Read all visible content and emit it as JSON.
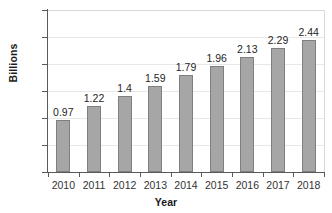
{
  "chart_data": {
    "type": "bar",
    "title": "",
    "subtitle": "",
    "xlabel": "Year",
    "ylabel": "Billions",
    "categories": [
      "2010",
      "2011",
      "2012",
      "2013",
      "2014",
      "2015",
      "2016",
      "2017",
      "2018"
    ],
    "values": [
      0.97,
      1.22,
      1.4,
      1.59,
      1.79,
      1.96,
      2.13,
      2.29,
      2.44
    ],
    "data_labels": [
      "0.97",
      "1.22",
      "1.4",
      "1.59",
      "1.79",
      "1.96",
      "2.13",
      "2.29",
      "2.44"
    ],
    "ylim": [
      0,
      3
    ],
    "ytick_values": [
      0,
      0.5,
      1,
      1.5,
      2,
      2.5,
      3
    ],
    "ytick_labels": [
      "0",
      "0.5",
      "1",
      "1.5",
      "2",
      "2.5",
      "3"
    ],
    "grid": true,
    "grid_axis": "y",
    "legend": false,
    "legend_position": "none",
    "bar_color": "#a6a6a6",
    "bar_border_color": "#7f7f7f",
    "gridline_color": "#e8e8e8",
    "axis_color": "#595959",
    "background_color": "#ffffff",
    "text_color": "#262626"
  }
}
